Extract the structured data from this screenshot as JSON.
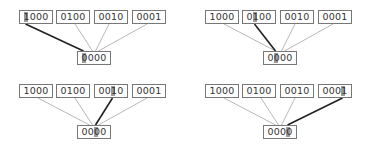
{
  "colors": {
    "box_border": "#777777",
    "thin_line": "#888888",
    "thick_line": "#222222",
    "highlight": "#8a8a8a"
  },
  "panels": [
    {
      "top_nodes": [
        "1000",
        "0100",
        "0010",
        "0001"
      ],
      "bottom_node": "0000",
      "highlighted_top_index": 0,
      "highlighted_bit": 0
    },
    {
      "top_nodes": [
        "1000",
        "0100",
        "0010",
        "0001"
      ],
      "bottom_node": "0000",
      "highlighted_top_index": 1,
      "highlighted_bit": 1
    },
    {
      "top_nodes": [
        "1000",
        "0100",
        "0010",
        "0001"
      ],
      "bottom_node": "0000",
      "highlighted_top_index": 2,
      "highlighted_bit": 2
    },
    {
      "top_nodes": [
        "1000",
        "0100",
        "0010",
        "0001"
      ],
      "bottom_node": "0000",
      "highlighted_top_index": 3,
      "highlighted_bit": 3
    }
  ]
}
